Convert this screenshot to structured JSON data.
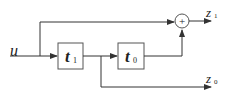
{
  "diagram": {
    "type": "block-diagram",
    "input": {
      "label": "u"
    },
    "blocks": [
      {
        "id": "t1",
        "label": "t",
        "subscript": "1"
      },
      {
        "id": "t0",
        "label": "t",
        "subscript": "0"
      }
    ],
    "summing_junction": {
      "symbol": "+"
    },
    "outputs": [
      {
        "id": "z1",
        "label": "z",
        "subscript": "1"
      },
      {
        "id": "z0",
        "label": "z",
        "subscript": "0"
      }
    ],
    "colors": {
      "line": "#333333",
      "box_border": "#555555",
      "background": "#ffffff"
    }
  }
}
